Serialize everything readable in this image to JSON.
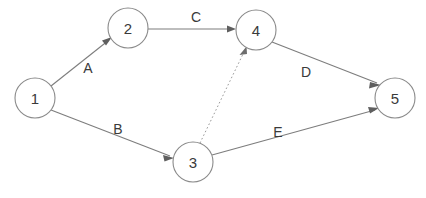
{
  "diagram": {
    "background_color": "#ffffff",
    "node_stroke_color": "#8a8a8a",
    "edge_stroke_color": "#7d7d7d",
    "text_color": "#3a3a3a",
    "nodes": [
      {
        "id": "1",
        "label": "1",
        "cx": 35,
        "cy": 98,
        "r": 20
      },
      {
        "id": "2",
        "label": "2",
        "cx": 128,
        "cy": 28,
        "r": 20
      },
      {
        "id": "3",
        "label": "3",
        "cx": 193,
        "cy": 162,
        "r": 20
      },
      {
        "id": "4",
        "label": "4",
        "cx": 256,
        "cy": 30,
        "r": 20
      },
      {
        "id": "5",
        "label": "5",
        "cx": 395,
        "cy": 98,
        "r": 20
      }
    ],
    "edges": [
      {
        "id": "A",
        "label": "A",
        "from": "1",
        "to": "2",
        "style": "solid",
        "label_x": 88,
        "label_y": 68
      },
      {
        "id": "B",
        "label": "B",
        "from": "1",
        "to": "3",
        "style": "solid",
        "label_x": 118,
        "label_y": 129
      },
      {
        "id": "C",
        "label": "C",
        "from": "2",
        "to": "4",
        "style": "solid",
        "label_x": 196,
        "label_y": 17
      },
      {
        "id": "D",
        "label": "D",
        "from": "4",
        "to": "5",
        "style": "solid",
        "label_x": 306,
        "label_y": 72
      },
      {
        "id": "E",
        "label": "E",
        "from": "3",
        "to": "5",
        "style": "solid",
        "label_x": 278,
        "label_y": 132
      },
      {
        "id": "F",
        "label": "",
        "from": "3",
        "to": "4",
        "style": "dotted",
        "label_x": 0,
        "label_y": 0
      }
    ]
  }
}
